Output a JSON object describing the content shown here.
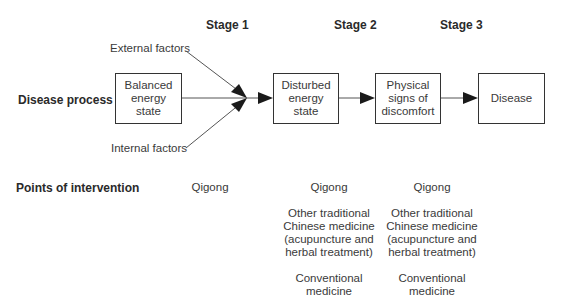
{
  "stages": [
    {
      "label": "Stage 1"
    },
    {
      "label": "Stage 2"
    },
    {
      "label": "Stage 3"
    }
  ],
  "row_labels": {
    "disease_process": "Disease process",
    "points_of_intervention": "Points of intervention"
  },
  "factors": {
    "external": "External factors",
    "internal": "Internal factors"
  },
  "boxes": [
    {
      "lines": [
        "Balanced",
        "energy",
        "state"
      ]
    },
    {
      "lines": [
        "Disturbed",
        "energy",
        "state"
      ]
    },
    {
      "lines": [
        "Physical",
        "signs of",
        "discomfort"
      ]
    },
    {
      "lines": [
        "Disease"
      ]
    }
  ],
  "interventions": {
    "stage1": [
      "Qigong"
    ],
    "stage2": [
      "Qigong",
      [
        "Other traditional",
        "Chinese medicine",
        "(acupuncture and",
        "herbal treatment)"
      ],
      [
        "Conventional",
        "medicine"
      ]
    ],
    "stage3": [
      "Qigong",
      [
        "Other traditional",
        "Chinese medicine",
        "(acupuncture and",
        "herbal treatment)"
      ],
      [
        "Conventional",
        "medicine"
      ]
    ]
  },
  "colors": {
    "line": "#555555",
    "border": "#333333",
    "text": "#333333"
  }
}
